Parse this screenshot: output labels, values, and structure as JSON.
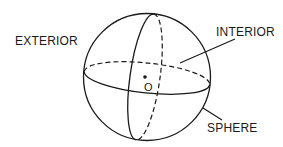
{
  "diagram": {
    "labels": {
      "exterior": "EXTERIOR",
      "interior": "INTERIOR",
      "sphere": "SPHERE",
      "center": "O"
    },
    "colors": {
      "stroke": "#1a1a1a",
      "background": "#ffffff"
    }
  }
}
